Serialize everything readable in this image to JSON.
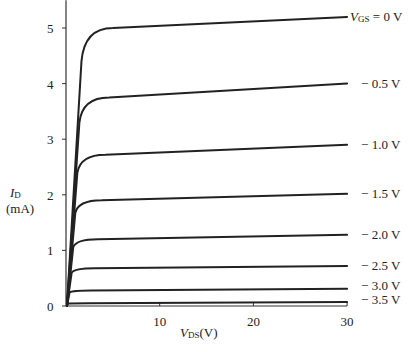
{
  "chart_data": {
    "type": "line",
    "title": "",
    "xlabel": "V_DS (V)",
    "ylabel": "I_D (mA)",
    "xlim": [
      0,
      30
    ],
    "ylim": [
      0,
      5.2
    ],
    "x_ticks": [
      10,
      20,
      30
    ],
    "y_ticks": [
      0,
      1,
      2,
      3,
      4,
      5
    ],
    "grid": false,
    "legend": "inline labels at right end of each curve",
    "parameter": "V_GS",
    "series": [
      {
        "name": "V_GS = 0 V",
        "label": "= 0 V",
        "sat_current": 5.0,
        "end_current": 5.2,
        "knee_v": 3.0
      },
      {
        "name": "-0.5 V",
        "label": "− 0.5 V",
        "sat_current": 3.75,
        "end_current": 4.0,
        "knee_v": 2.6
      },
      {
        "name": "-1.0 V",
        "label": "− 1.0 V",
        "sat_current": 2.72,
        "end_current": 2.9,
        "knee_v": 2.2
      },
      {
        "name": "-1.5 V",
        "label": "− 1.5 V",
        "sat_current": 1.9,
        "end_current": 2.02,
        "knee_v": 1.8
      },
      {
        "name": "-2.0 V",
        "label": "− 2.0 V",
        "sat_current": 1.2,
        "end_current": 1.28,
        "knee_v": 1.4
      },
      {
        "name": "-2.5 V",
        "label": "− 2.5 V",
        "sat_current": 0.68,
        "end_current": 0.72,
        "knee_v": 1.1
      },
      {
        "name": "-3.0 V",
        "label": "− 3.0 V",
        "sat_current": 0.28,
        "end_current": 0.31,
        "knee_v": 0.7
      },
      {
        "name": "-3.5 V",
        "label": "− 3.5 V",
        "sat_current": 0.05,
        "end_current": 0.07,
        "knee_v": 0.4
      }
    ]
  },
  "labels": {
    "y_axis_symbol": "I",
    "y_axis_sub": "D",
    "y_axis_unit": "(mA)",
    "x_axis_symbol": "V",
    "x_axis_sub": "DS",
    "x_axis_unit": "(V)",
    "vgs_symbol": "V",
    "vgs_sub": "GS"
  }
}
